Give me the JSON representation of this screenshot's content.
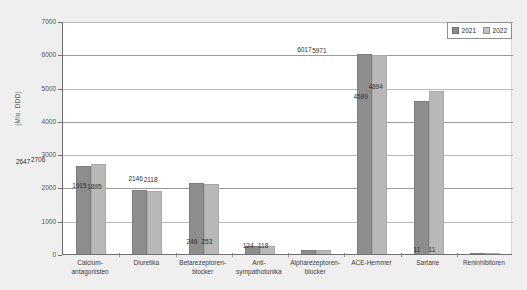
{
  "chart_data": {
    "type": "bar",
    "title": "",
    "subtitle": "",
    "xlabel": "",
    "ylabel": "(Mio. DDD)",
    "ylim": [
      0,
      7000
    ],
    "ytick_values": [
      0,
      1000,
      2000,
      3000,
      4000,
      5000,
      6000,
      7000
    ],
    "ytick_labels": [
      "0",
      "1000",
      "2000",
      "3000",
      "4000",
      "5000",
      "6000",
      "7000"
    ],
    "grid": true,
    "grid_axis": "y",
    "legend_position": "top-right",
    "categories": [
      "Calcium-\nantagonisten",
      "Diuretika",
      "Betarezeptoren-\nblocker",
      "Anti-\nsympathotonika",
      "Alpharezeptoren-\nblocker",
      "ACE-Hemmer",
      "Sartane",
      "Reninhibitoren"
    ],
    "series": [
      {
        "name": "2021",
        "color": "#8d8d8d",
        "values": [
          2647,
          1915,
          2146,
          246,
          124,
          6017,
          4599,
          11
        ],
        "labels": [
          "2647",
          "1915",
          "2146",
          "246",
          "124",
          "6017",
          "4599",
          "11"
        ]
      },
      {
        "name": "2022",
        "color": "#b8b8b8",
        "values": [
          2706,
          1895,
          2118,
          253,
          118,
          5971,
          4894,
          11
        ],
        "labels": [
          "2706",
          "1895",
          "2118",
          "253",
          "118",
          "5971",
          "4894",
          "11"
        ]
      }
    ]
  },
  "legend": {
    "entries": [
      "2021",
      "2022"
    ]
  },
  "colors": {
    "series_2021": "#8d8d8d",
    "series_2022": "#b8b8b8",
    "page_background": "#efefef",
    "plot_background": "#ffffff",
    "axis": "#6f6f6f",
    "gridline": "#9a9a9a"
  }
}
